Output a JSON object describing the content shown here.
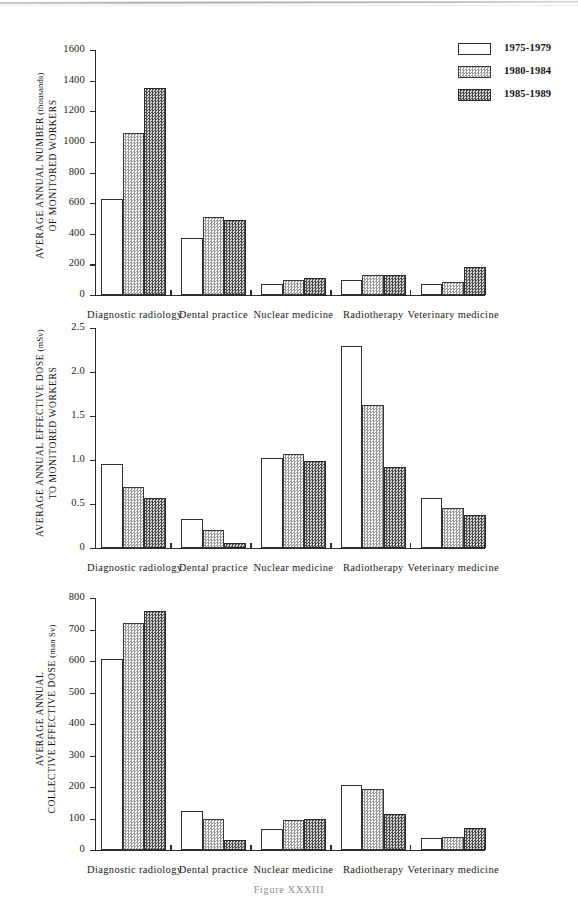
{
  "figure": {
    "caption": "Figure XXXIII",
    "legend": {
      "items": [
        {
          "label": "1975-1979",
          "fill": "white",
          "color": "#ffffff"
        },
        {
          "label": "1980-1984",
          "fill": "light-stipple",
          "color": "#d0d0d0"
        },
        {
          "label": "1985-1989",
          "fill": "dark-stipple",
          "color": "#8a8a8a"
        }
      ]
    }
  },
  "chart_data": [
    {
      "type": "bar",
      "title": "",
      "xlabel": "",
      "ylabel": "AVERAGE ANNUAL NUMBER OF MONITORED WORKERS (thousands)",
      "ylabel_main": "AVERAGE ANNUAL NUMBER",
      "ylabel_second": "OF MONITORED WORKERS",
      "ylabel_unit": "(thousands)",
      "ylim": [
        0,
        1600
      ],
      "yticks": [
        0,
        200,
        400,
        600,
        800,
        1000,
        1200,
        1400,
        1600
      ],
      "ytick_labels": [
        "0",
        "200",
        "400",
        "600",
        "800",
        "1000",
        "1200",
        "1400",
        "1600"
      ],
      "grid": false,
      "legend_position": "top-right",
      "categories": [
        "Diagnostic radiology",
        "Dental practice",
        "Nuclear medicine",
        "Radiotherapy",
        "Veterinary medicine"
      ],
      "series": [
        {
          "name": "1975-1979",
          "values": [
            630,
            375,
            70,
            100,
            70
          ]
        },
        {
          "name": "1980-1984",
          "values": [
            1055,
            508,
            95,
            130,
            87
          ]
        },
        {
          "name": "1985-1989",
          "values": [
            1350,
            487,
            110,
            132,
            186
          ]
        }
      ]
    },
    {
      "type": "bar",
      "title": "",
      "xlabel": "",
      "ylabel": "AVERAGE ANNUAL EFFECTIVE DOSE TO MONITORED WORKERS (mSv)",
      "ylabel_main": "AVERAGE ANNUAL EFFECTIVE DOSE",
      "ylabel_second": "TO MONITORED WORKERS",
      "ylabel_unit": "(mSv)",
      "ylim": [
        0,
        2.5
      ],
      "yticks": [
        0,
        0.5,
        1.0,
        1.5,
        2.0,
        2.5
      ],
      "ytick_labels": [
        "0",
        "0.5",
        "1.0",
        "1.5",
        "2.0",
        "2.5"
      ],
      "grid": false,
      "legend_position": "none",
      "categories": [
        "Diagnostic radiology",
        "Dental practice",
        "Nuclear medicine",
        "Radiotherapy",
        "Veterinary medicine"
      ],
      "series": [
        {
          "name": "1975-1979",
          "values": [
            0.95,
            0.33,
            1.02,
            2.29,
            0.57
          ]
        },
        {
          "name": "1980-1984",
          "values": [
            0.69,
            0.21,
            1.07,
            1.63,
            0.45
          ]
        },
        {
          "name": "1985-1989",
          "values": [
            0.57,
            0.06,
            0.99,
            0.92,
            0.37
          ]
        }
      ]
    },
    {
      "type": "bar",
      "title": "",
      "xlabel": "",
      "ylabel": "AVERAGE ANNUAL COLLECTIVE EFFECTIVE DOSE (man Sv)",
      "ylabel_main": "AVERAGE ANNUAL",
      "ylabel_second": "COLLECTIVE EFFECTIVE DOSE",
      "ylabel_unit": "(man Sv)",
      "ylim": [
        0,
        800
      ],
      "yticks": [
        0,
        100,
        200,
        300,
        400,
        500,
        600,
        700,
        800
      ],
      "ytick_labels": [
        "0",
        "100",
        "200",
        "300",
        "400",
        "500",
        "600",
        "700",
        "800"
      ],
      "grid": false,
      "legend_position": "none",
      "categories": [
        "Diagnostic radiology",
        "Dental practice",
        "Nuclear medicine",
        "Radiotherapy",
        "Veterinary medicine"
      ],
      "series": [
        {
          "name": "1975-1979",
          "values": [
            605,
            125,
            67,
            205,
            38
          ]
        },
        {
          "name": "1980-1984",
          "values": [
            720,
            100,
            95,
            195,
            40
          ]
        },
        {
          "name": "1985-1989",
          "values": [
            758,
            33,
            97,
            115,
            70
          ]
        }
      ]
    }
  ]
}
